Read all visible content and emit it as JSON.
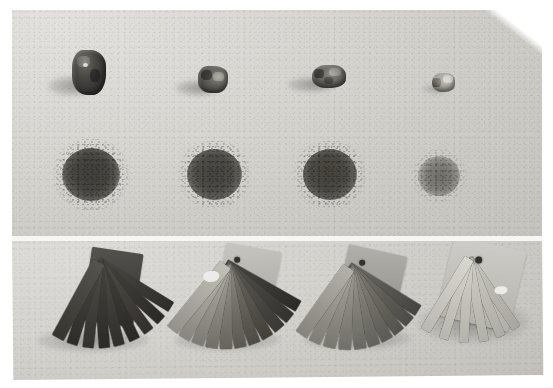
{
  "figure": {
    "kind": "grayscale-photograph",
    "caption_text": "",
    "background_color": "#ffffff",
    "print_color": "#cdccc8",
    "panel_count": 2,
    "divider_color": "#f4f3f1"
  },
  "panels": [
    {
      "id": "top-panel",
      "name": "rock-and-powder-panel",
      "rows": [
        {
          "id": "rock-row",
          "name": "rock-specimen-row",
          "label": "hand specimens",
          "items": [
            {
              "name": "rock-specimen-1",
              "order": "1",
              "tone": "very dark",
              "tone_hex": "#403e3b",
              "rel_size": "largest",
              "cx": 90,
              "cy": 72,
              "w": 34,
              "h": 44
            },
            {
              "name": "rock-specimen-2",
              "order": "2",
              "tone": "dark",
              "tone_hex": "#5b5954",
              "rel_size": "medium",
              "cx": 212,
              "cy": 78,
              "w": 29,
              "h": 28
            },
            {
              "name": "rock-specimen-3",
              "order": "3",
              "tone": "medium",
              "tone_hex": "#6d6b65",
              "rel_size": "medium",
              "cx": 326,
              "cy": 75,
              "w": 33,
              "h": 24
            },
            {
              "name": "rock-specimen-4",
              "order": "4",
              "tone": "light",
              "tone_hex": "#9b9992",
              "rel_size": "smallest",
              "cx": 443,
              "cy": 81,
              "w": 22,
              "h": 18
            }
          ]
        },
        {
          "id": "powder-row",
          "name": "powder-spot-row",
          "label": "powder streak spots",
          "items": [
            {
              "name": "powder-spot-1",
              "order": "1",
              "tone": "very dark",
              "tone_hex": "#494743",
              "diameter": 56,
              "cx": 88,
              "cy": 176
            },
            {
              "name": "powder-spot-2",
              "order": "2",
              "tone": "dark",
              "tone_hex": "#4f4d49",
              "diameter": 54,
              "cx": 212,
              "cy": 176
            },
            {
              "name": "powder-spot-3",
              "order": "3",
              "tone": "dark",
              "tone_hex": "#4d4b47",
              "diameter": 53,
              "cx": 329,
              "cy": 176
            },
            {
              "name": "powder-spot-4",
              "order": "4",
              "tone": "faint",
              "tone_hex": "#7b7974",
              "diameter": 34,
              "cx": 438,
              "cy": 181
            }
          ]
        }
      ]
    },
    {
      "id": "bottom-panel",
      "name": "chip-fan-panel",
      "rows": [
        {
          "id": "fan-row",
          "name": "color-chip-fan-row",
          "label": "fanned colour chip sets",
          "items": [
            {
              "name": "chip-fan-1",
              "order": "1",
              "tone": "very dark",
              "tone_hex": "#454340",
              "blade_count": 9,
              "cx": 78,
              "cy": 300,
              "has_hole": false,
              "has_highlight": false
            },
            {
              "name": "chip-fan-2",
              "order": "2",
              "tone": "dark-to-light",
              "tone_hex": "#6a6863",
              "blade_count": 11,
              "cx": 212,
              "cy": 300,
              "has_hole": true,
              "has_highlight": true
            },
            {
              "name": "chip-fan-3",
              "order": "3",
              "tone": "medium",
              "tone_hex": "#7d7b75",
              "blade_count": 10,
              "cx": 344,
              "cy": 300,
              "has_hole": true,
              "has_highlight": false
            },
            {
              "name": "chip-fan-4",
              "order": "4",
              "tone": "light",
              "tone_hex": "#b3b1ab",
              "blade_count": 6,
              "cx": 470,
              "cy": 298,
              "has_hole": true,
              "has_highlight": true
            }
          ]
        }
      ]
    }
  ]
}
